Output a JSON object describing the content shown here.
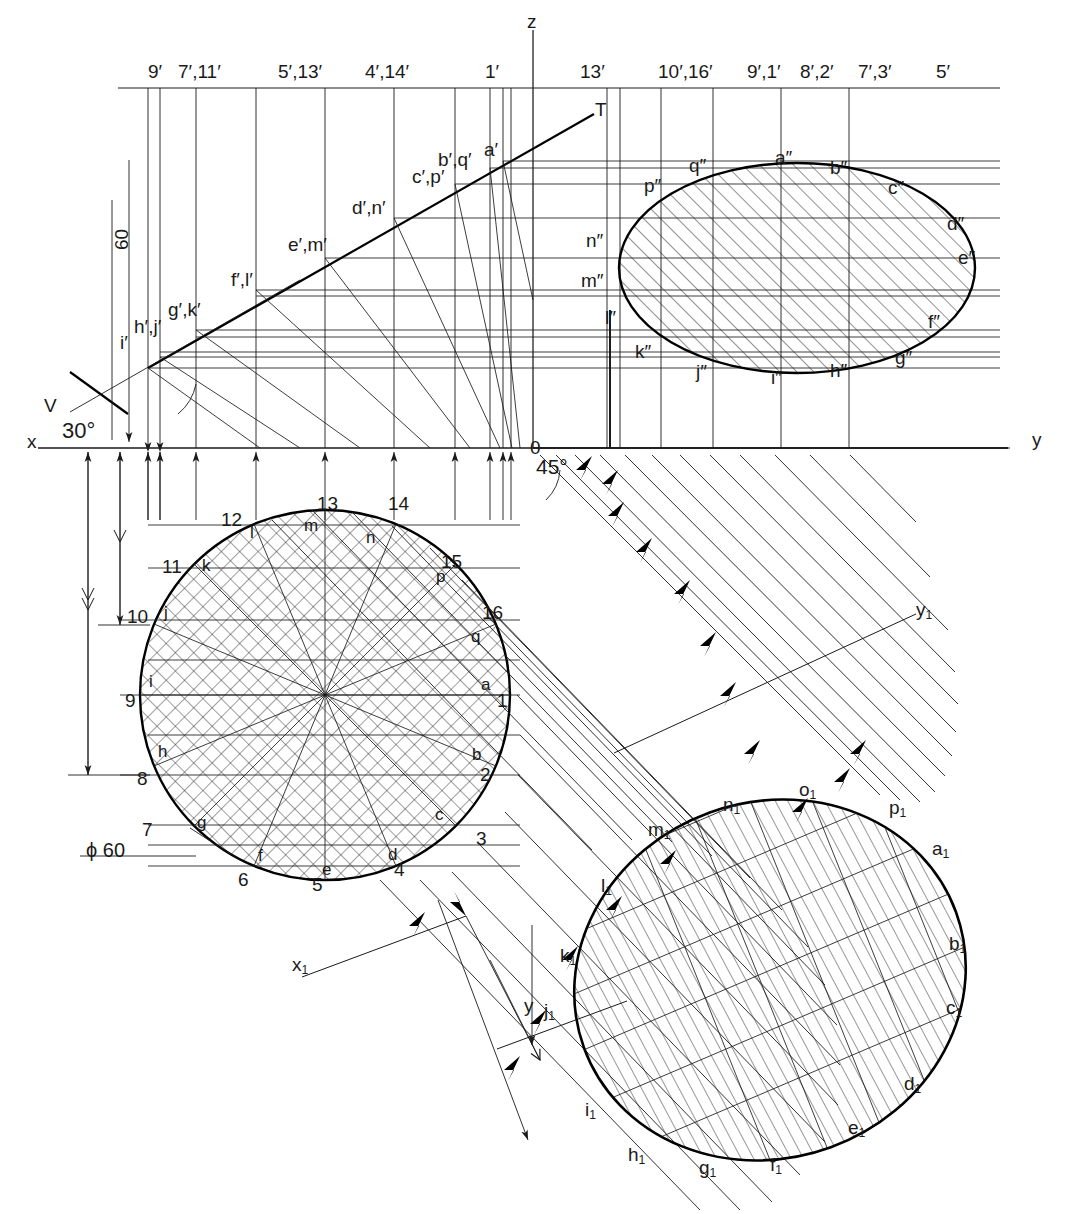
{
  "drawing": {
    "title": "Orthographic projection of an inclined circular section",
    "stroke_color": "#1a1a1a",
    "thick_color": "#000000",
    "background": "#ffffff"
  },
  "axes": {
    "z_label": "z",
    "x_label": "x",
    "y_label": "y",
    "x1_label": "x",
    "x1_sub": "1",
    "y1_label": "y",
    "y1_sub": "1",
    "aux_y_label": "y",
    "origin_label": "0",
    "trace_label": "T",
    "vertical_plane_label": "V"
  },
  "dimensions": {
    "height_60": "60",
    "diameter": "ϕ 60",
    "angle_30": "30°",
    "angle_45": "45°"
  },
  "top_ordinate_labels": [
    {
      "text": "9′",
      "x": 166,
      "y": 72
    },
    {
      "text": "7′,11′",
      "x": 196,
      "y": 72
    },
    {
      "text": "5′,13′",
      "x": 296,
      "y": 72
    },
    {
      "text": "4′,14′",
      "x": 383,
      "y": 72
    },
    {
      "text": "1′",
      "x": 503,
      "y": 72
    },
    {
      "text": "13′",
      "x": 598,
      "y": 72
    },
    {
      "text": "10′,16′",
      "x": 676,
      "y": 72
    },
    {
      "text": "9′,1′",
      "x": 765,
      "y": 72
    },
    {
      "text": "8′,2′",
      "x": 818,
      "y": 72
    },
    {
      "text": "7′,3′",
      "x": 876,
      "y": 72
    },
    {
      "text": "5′",
      "x": 954,
      "y": 72
    }
  ],
  "front_view_labels": [
    {
      "text": "i′",
      "x": 132,
      "y": 343
    },
    {
      "text": "h′,j′",
      "x": 146,
      "y": 327
    },
    {
      "text": "g′,k′",
      "x": 180,
      "y": 310
    },
    {
      "text": "f′,l′",
      "x": 243,
      "y": 280
    },
    {
      "text": "e′,m′",
      "x": 300,
      "y": 245
    },
    {
      "text": "d′,n′",
      "x": 364,
      "y": 208
    },
    {
      "text": "c′,p′",
      "x": 424,
      "y": 177
    },
    {
      "text": "b′,q′",
      "x": 450,
      "y": 160
    },
    {
      "text": "a′",
      "x": 496,
      "y": 150
    }
  ],
  "side_view_labels": [
    {
      "text": "q″",
      "x": 697,
      "y": 166
    },
    {
      "text": "a″",
      "x": 783,
      "y": 158
    },
    {
      "text": "b″",
      "x": 838,
      "y": 168
    },
    {
      "text": "c″",
      "x": 896,
      "y": 188
    },
    {
      "text": "d″",
      "x": 955,
      "y": 224
    },
    {
      "text": "e″",
      "x": 966,
      "y": 258
    },
    {
      "text": "f″",
      "x": 936,
      "y": 322
    },
    {
      "text": "g″",
      "x": 903,
      "y": 358
    },
    {
      "text": "h″",
      "x": 838,
      "y": 371
    },
    {
      "text": "i″",
      "x": 779,
      "y": 378
    },
    {
      "text": "j″",
      "x": 704,
      "y": 372
    },
    {
      "text": "k″",
      "x": 643,
      "y": 352
    },
    {
      "text": "l″",
      "x": 613,
      "y": 318
    },
    {
      "text": "m″",
      "x": 589,
      "y": 281
    },
    {
      "text": "n″",
      "x": 594,
      "y": 241
    },
    {
      "text": "p″",
      "x": 652,
      "y": 186
    }
  ],
  "plan_point_labels": [
    {
      "text": "a",
      "x": 487,
      "y": 685
    },
    {
      "text": "b",
      "x": 478,
      "y": 755
    },
    {
      "text": "c",
      "x": 441,
      "y": 815
    },
    {
      "text": "d",
      "x": 394,
      "y": 855
    },
    {
      "text": "e",
      "x": 328,
      "y": 870
    },
    {
      "text": "f",
      "x": 264,
      "y": 856
    },
    {
      "text": "g",
      "x": 203,
      "y": 823
    },
    {
      "text": "h",
      "x": 164,
      "y": 752
    },
    {
      "text": "i",
      "x": 155,
      "y": 682
    },
    {
      "text": "j",
      "x": 170,
      "y": 613
    },
    {
      "text": "k",
      "x": 208,
      "y": 566
    },
    {
      "text": "l",
      "x": 256,
      "y": 533
    },
    {
      "text": "m",
      "x": 310,
      "y": 526
    },
    {
      "text": "n",
      "x": 372,
      "y": 538
    },
    {
      "text": "p",
      "x": 442,
      "y": 577
    },
    {
      "text": "q",
      "x": 477,
      "y": 637
    }
  ],
  "plan_number_labels": [
    {
      "text": "1",
      "x": 507,
      "y": 700
    },
    {
      "text": "2",
      "x": 490,
      "y": 774
    },
    {
      "text": "3",
      "x": 486,
      "y": 838
    },
    {
      "text": "4",
      "x": 404,
      "y": 869
    },
    {
      "text": "5",
      "x": 322,
      "y": 884
    },
    {
      "text": "6",
      "x": 248,
      "y": 879
    },
    {
      "text": "7",
      "x": 152,
      "y": 829
    },
    {
      "text": "8",
      "x": 147,
      "y": 778
    },
    {
      "text": "9",
      "x": 135,
      "y": 700
    },
    {
      "text": "10",
      "x": 137,
      "y": 616
    },
    {
      "text": "11",
      "x": 172,
      "y": 566
    },
    {
      "text": "12",
      "x": 231,
      "y": 519
    },
    {
      "text": "13",
      "x": 327,
      "y": 503
    },
    {
      "text": "14",
      "x": 398,
      "y": 503
    },
    {
      "text": "15",
      "x": 451,
      "y": 561
    },
    {
      "text": "16",
      "x": 492,
      "y": 612
    }
  ],
  "aux_view_labels": [
    {
      "text": "a",
      "sub": "1",
      "x": 939,
      "y": 849
    },
    {
      "text": "b",
      "sub": "1",
      "x": 956,
      "y": 944
    },
    {
      "text": "c",
      "sub": "1",
      "x": 953,
      "y": 1008
    },
    {
      "text": "d",
      "sub": "1",
      "x": 911,
      "y": 1084
    },
    {
      "text": "e",
      "sub": "1",
      "x": 855,
      "y": 1128
    },
    {
      "text": "f",
      "sub": "1",
      "x": 777,
      "y": 1165
    },
    {
      "text": "g",
      "sub": "1",
      "x": 706,
      "y": 1168
    },
    {
      "text": "h",
      "sub": "1",
      "x": 635,
      "y": 1155
    },
    {
      "text": "i",
      "sub": "1",
      "x": 592,
      "y": 1110
    },
    {
      "text": "j",
      "sub": "1",
      "x": 551,
      "y": 1011
    },
    {
      "text": "k",
      "sub": "1",
      "x": 567,
      "y": 956
    },
    {
      "text": "l",
      "sub": "1",
      "x": 608,
      "y": 886
    },
    {
      "text": "m",
      "sub": "1",
      "x": 655,
      "y": 830
    },
    {
      "text": "n",
      "sub": "1",
      "x": 730,
      "y": 805
    },
    {
      "text": "o",
      "sub": "1",
      "x": 806,
      "y": 790
    },
    {
      "text": "p",
      "sub": "1",
      "x": 896,
      "y": 808
    }
  ],
  "chart_data": {
    "type": "diagram",
    "circle_diameter": 60,
    "vertical_dimension": 60,
    "trace_inclination_deg": 30,
    "projection_angle_deg": 45,
    "division_count": 16,
    "point_letters": [
      "a",
      "b",
      "c",
      "d",
      "e",
      "f",
      "g",
      "h",
      "i",
      "j",
      "k",
      "l",
      "m",
      "n",
      "p",
      "q"
    ],
    "point_numbers": [
      1,
      2,
      3,
      4,
      5,
      6,
      7,
      8,
      9,
      10,
      11,
      12,
      13,
      14,
      15,
      16
    ],
    "views": [
      "front",
      "top",
      "side",
      "auxiliary"
    ]
  }
}
